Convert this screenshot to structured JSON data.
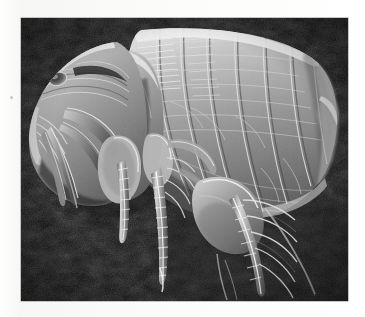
{
  "page": {
    "background_color": "#f8f8f6",
    "speck_color": "#bdbdbd"
  },
  "photo": {
    "name": "flea-sem-micrograph",
    "subject": "flea",
    "technique": "scanning electron micrograph",
    "color_mode": "grayscale",
    "frame": {
      "x": 21,
      "y": 18,
      "width": 327,
      "height": 283
    },
    "background_color": "#0d0d0d",
    "specimen_body_color": "#9a9a9a",
    "highlight_color": "#e8e8e8",
    "shadow_color": "#1a1a1a",
    "orientation": "head at left, abdomen at right, legs pointing down",
    "parts": [
      "head",
      "eye",
      "antenna",
      "mouthparts",
      "maxillary-palp",
      "pronotum",
      "thorax",
      "abdomen-segments",
      "foreleg",
      "midleg",
      "hindleg-femur",
      "hindleg-tibia",
      "tarsus",
      "setae-spines"
    ]
  }
}
